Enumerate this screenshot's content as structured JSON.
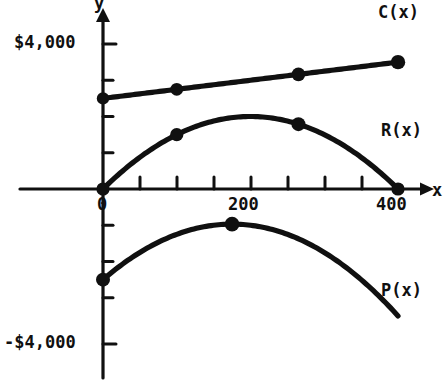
{
  "figure": {
    "background_color": "#ffffff",
    "ink_color": "#101010"
  },
  "axes": {
    "y_axis_name": "y",
    "x_axis_name": "x",
    "y_tick_labels": [
      {
        "text": "$4,000",
        "value": 4000
      },
      {
        "text": "-$4,000",
        "value": -4000
      }
    ],
    "x_tick_labels": [
      {
        "text": "0",
        "value": 0
      },
      {
        "text": "200",
        "value": 200
      },
      {
        "text": "400",
        "value": 400
      }
    ]
  },
  "curve_labels": {
    "cost": "C(x)",
    "revenue": "R(x)",
    "profit": "P(x)"
  },
  "chart_data": {
    "type": "line",
    "title": "",
    "xlabel": "x",
    "ylabel": "y",
    "xlim": [
      0,
      400
    ],
    "ylim": [
      -4800,
      4800
    ],
    "grid": false,
    "legend": "inline-curve-labels",
    "x_ticks": [
      0,
      50,
      100,
      150,
      200,
      250,
      300,
      350,
      400
    ],
    "x_tick_labels_shown": [
      "0",
      "200",
      "400"
    ],
    "y_ticks": [
      -4000,
      -3000,
      -2000,
      -1000,
      0,
      1000,
      2000,
      3000,
      4000
    ],
    "y_tick_labels_shown": [
      "$4,000",
      "-$4,000"
    ],
    "series": [
      {
        "name": "C(x)",
        "kind": "linear cost",
        "formula": "C(x) = 2500 + 2.5x",
        "color": "#101010",
        "x": [
          0,
          50,
          100,
          150,
          200,
          250,
          300,
          350,
          400
        ],
        "values": [
          2500,
          2625,
          2750,
          2875,
          3000,
          3125,
          3250,
          3375,
          3500
        ],
        "marked_points": [
          {
            "x": 0,
            "y": 2500
          },
          {
            "x": 100,
            "y": 2750
          },
          {
            "x": 265,
            "y": 3163
          },
          {
            "x": 400,
            "y": 3500
          }
        ]
      },
      {
        "name": "R(x)",
        "kind": "quadratic revenue",
        "formula": "R(x) = 20x - 0.05x^2",
        "color": "#101010",
        "x": [
          0,
          50,
          100,
          150,
          200,
          250,
          300,
          350,
          400
        ],
        "values": [
          0,
          875,
          1500,
          1875,
          2000,
          1875,
          1500,
          875,
          0
        ],
        "marked_points": [
          {
            "x": 0,
            "y": 0
          },
          {
            "x": 100,
            "y": 1500
          },
          {
            "x": 265,
            "y": 1788
          },
          {
            "x": 400,
            "y": 0
          }
        ]
      },
      {
        "name": "P(x)",
        "kind": "quadratic profit",
        "formula": "P(x) = R(x) - C(x) = -2500 + 17.5x - 0.05x^2",
        "color": "#101010",
        "x": [
          0,
          50,
          100,
          150,
          200,
          250,
          300,
          350,
          400
        ],
        "values": [
          -2500,
          -1750,
          -1250,
          -1000,
          -1000,
          -1250,
          -1750,
          -2500,
          -3500
        ],
        "marked_points": [
          {
            "x": 0,
            "y": -2500
          },
          {
            "x": 175,
            "y": -960
          },
          {
            "x": 400,
            "y": -3500
          }
        ]
      }
    ],
    "intersections": [
      {
        "label": "C and R cross",
        "x": 100,
        "y": 2750
      },
      {
        "label": "C and R cross",
        "x": 265,
        "y": 3163
      }
    ]
  }
}
